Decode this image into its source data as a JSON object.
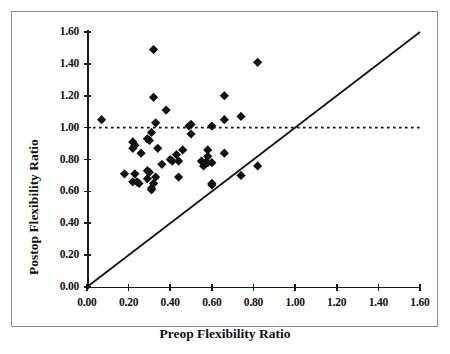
{
  "chart_data": {
    "type": "scatter",
    "title": "",
    "xlabel": "Preop Flexibility Ratio",
    "ylabel": "Postop Flexibility Ratio",
    "xlim": [
      0.0,
      1.6
    ],
    "ylim": [
      0.0,
      1.6
    ],
    "xticks": [
      "0.00",
      "0.20",
      "0.40",
      "0.60",
      "0.80",
      "1.00",
      "1.20",
      "1.40",
      "1.60"
    ],
    "yticks": [
      "0.00",
      "0.20",
      "0.40",
      "0.60",
      "0.80",
      "1.00",
      "1.20",
      "1.40",
      "1.60"
    ],
    "xtick_values": [
      0.0,
      0.2,
      0.4,
      0.6,
      0.8,
      1.0,
      1.2,
      1.4,
      1.6
    ],
    "ytick_values": [
      0.0,
      0.2,
      0.4,
      0.6,
      0.8,
      1.0,
      1.2,
      1.4,
      1.6
    ],
    "grid": false,
    "legend": null,
    "marker_style": "filled-diamond",
    "marker_color": "#111111",
    "annotations": [
      {
        "name": "reference-line-y1",
        "type": "horizontal-dotted-line",
        "y": 1.0,
        "x_from": 0.0,
        "x_to": 1.6,
        "style": "dotted"
      },
      {
        "name": "identity-line",
        "type": "line",
        "from": [
          0.0,
          0.0
        ],
        "to": [
          1.6,
          1.6
        ],
        "style": "solid"
      }
    ],
    "points": [
      [
        0.07,
        1.05
      ],
      [
        0.32,
        1.49
      ],
      [
        0.82,
        1.41
      ],
      [
        0.32,
        1.19
      ],
      [
        0.66,
        1.2
      ],
      [
        0.38,
        1.11
      ],
      [
        0.33,
        1.03
      ],
      [
        0.49,
        1.01
      ],
      [
        0.5,
        1.02
      ],
      [
        0.6,
        1.01
      ],
      [
        0.66,
        1.05
      ],
      [
        0.74,
        1.07
      ],
      [
        0.31,
        0.97
      ],
      [
        0.5,
        0.96
      ],
      [
        0.22,
        0.91
      ],
      [
        0.23,
        0.89
      ],
      [
        0.29,
        0.93
      ],
      [
        0.3,
        0.92
      ],
      [
        0.22,
        0.87
      ],
      [
        0.26,
        0.84
      ],
      [
        0.34,
        0.87
      ],
      [
        0.46,
        0.86
      ],
      [
        0.58,
        0.86
      ],
      [
        0.66,
        0.84
      ],
      [
        0.43,
        0.83
      ],
      [
        0.58,
        0.82
      ],
      [
        0.4,
        0.8
      ],
      [
        0.41,
        0.79
      ],
      [
        0.44,
        0.79
      ],
      [
        0.55,
        0.79
      ],
      [
        0.57,
        0.78
      ],
      [
        0.58,
        0.78
      ],
      [
        0.6,
        0.78
      ],
      [
        0.36,
        0.77
      ],
      [
        0.56,
        0.76
      ],
      [
        0.82,
        0.76
      ],
      [
        0.29,
        0.73
      ],
      [
        0.3,
        0.72
      ],
      [
        0.18,
        0.71
      ],
      [
        0.23,
        0.71
      ],
      [
        0.74,
        0.7
      ],
      [
        0.44,
        0.69
      ],
      [
        0.33,
        0.69
      ],
      [
        0.29,
        0.68
      ],
      [
        0.22,
        0.66
      ],
      [
        0.24,
        0.66
      ],
      [
        0.25,
        0.65
      ],
      [
        0.32,
        0.65
      ],
      [
        0.6,
        0.65
      ],
      [
        0.6,
        0.64
      ],
      [
        0.31,
        0.62
      ],
      [
        0.31,
        0.61
      ]
    ]
  }
}
